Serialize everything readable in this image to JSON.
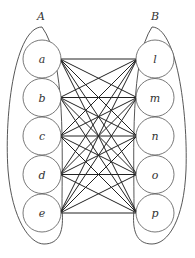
{
  "diagram": {
    "type": "complete bipartite graph",
    "sets": [
      {
        "label": "A",
        "nodes": [
          "a",
          "b",
          "c",
          "d",
          "e"
        ]
      },
      {
        "label": "B",
        "nodes": [
          "l",
          "m",
          "n",
          "o",
          "p"
        ]
      }
    ],
    "edges": "every node in A connected to every node in B"
  }
}
